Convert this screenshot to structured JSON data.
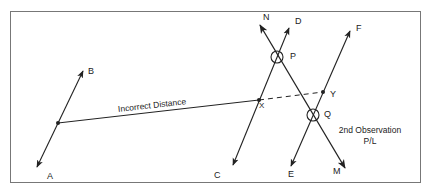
{
  "diagram": {
    "type": "survey-position-line-correction",
    "colors": {
      "line": "#222222",
      "frame": "#777777",
      "background": "#ffffff"
    },
    "points": {
      "A": {
        "label": "A",
        "x": 47,
        "y": 177
      },
      "B": {
        "label": "B",
        "x": 91,
        "y": 72
      },
      "C": {
        "label": "C",
        "x": 217,
        "y": 176
      },
      "D": {
        "label": "D",
        "x": 296,
        "y": 21
      },
      "E": {
        "label": "E",
        "x": 289,
        "y": 175
      },
      "F": {
        "label": "F",
        "x": 356,
        "y": 27
      },
      "M": {
        "label": "M",
        "x": 334,
        "y": 172
      },
      "N": {
        "label": "N",
        "x": 264,
        "y": 16
      },
      "P": {
        "label": "P",
        "x": 291,
        "y": 55
      },
      "Q": {
        "label": "Q",
        "x": 324,
        "y": 114
      },
      "X": {
        "label": "X",
        "x": 260,
        "y": 104
      },
      "Y": {
        "label": "Y",
        "x": 331,
        "y": 93
      }
    },
    "annotations": {
      "incorrect_distance": "Incorrect Distance",
      "second_observation_line1": "2nd Observation",
      "second_observation_line2": "P/L"
    },
    "lines": [
      {
        "name": "AB",
        "from": "A",
        "to": "B",
        "style": "solid",
        "arrows": "both"
      },
      {
        "name": "CD",
        "from": "C",
        "to": "D",
        "style": "solid",
        "arrows": "both"
      },
      {
        "name": "NM",
        "from": "N",
        "to": "M",
        "style": "solid",
        "arrows": "both"
      },
      {
        "name": "EF",
        "from": "E",
        "to": "F",
        "style": "solid",
        "arrows": "both"
      },
      {
        "name": "incorrect-distance",
        "from": "AB-midpoint",
        "to": "X",
        "style": "solid"
      },
      {
        "name": "XY",
        "from": "X",
        "to": "Y",
        "style": "dashed"
      }
    ],
    "circled_intersections": [
      "P",
      "Q"
    ]
  }
}
